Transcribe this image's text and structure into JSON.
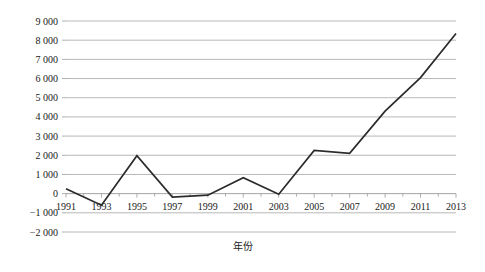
{
  "chart_data": {
    "type": "line",
    "title": "",
    "xlabel": "年份",
    "ylabel": "粮食净进口量/万吨",
    "categories": [
      1991,
      1993,
      1995,
      1997,
      1999,
      2001,
      2003,
      2005,
      2007,
      2009,
      2011,
      2013
    ],
    "values": [
      250,
      -600,
      1980,
      -180,
      -80,
      830,
      -30,
      2250,
      2100,
      4300,
      6050,
      8350
    ],
    "series": [
      {
        "name": "粮食净进口量",
        "values": [
          250,
          -600,
          1980,
          -180,
          -80,
          830,
          -30,
          2250,
          2100,
          4300,
          6050,
          8350
        ]
      }
    ],
    "xlim": [
      1991,
      2013
    ],
    "ylim": [
      -2000,
      9000
    ],
    "ytick_step": 1000,
    "ytick_labels": [
      "9 000",
      "8 000",
      "7 000",
      "6 000",
      "5 000",
      "4 000",
      "3 000",
      "2 000",
      "1 000",
      "0",
      "−1 000",
      "−2 000"
    ],
    "ytick_values": [
      9000,
      8000,
      7000,
      6000,
      5000,
      4000,
      3000,
      2000,
      1000,
      0,
      -1000,
      -2000
    ],
    "xtick_labels": [
      "1991",
      "1993",
      "1995",
      "1997",
      "1999",
      "2001",
      "2003",
      "2005",
      "2007",
      "2009",
      "2011",
      "2013"
    ],
    "grid": true,
    "grid_axis": "y",
    "legend": false,
    "legend_position": "none",
    "line_color": "#2b2b2b",
    "grid_color": "#a6a6a6",
    "background_color": "#ffffff",
    "markers": false
  }
}
